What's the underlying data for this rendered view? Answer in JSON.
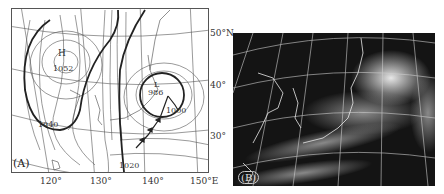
{
  "figure": {
    "panels": [
      {
        "id": "A",
        "label": "(A)",
        "type": "surface-weather-map",
        "longitude_labels": [
          "120°",
          "130°",
          "140°",
          "150°E"
        ],
        "latitude_labels": [
          "50°N",
          "40°",
          "30°"
        ],
        "pressure_centers": [
          {
            "type": "high",
            "symbol": "H",
            "value": "1052"
          },
          {
            "type": "low",
            "symbol": "L",
            "value": "986"
          }
        ],
        "isobar_labels": [
          "1040",
          "1020",
          "1000"
        ],
        "colors": {
          "line": "#333333",
          "background": "#ffffff"
        }
      },
      {
        "id": "B",
        "label": "(B)",
        "type": "satellite-image",
        "colors": {
          "background": "#141414",
          "grid": "#cfcfcf",
          "cloud": "#e6e6e6"
        }
      }
    ]
  }
}
